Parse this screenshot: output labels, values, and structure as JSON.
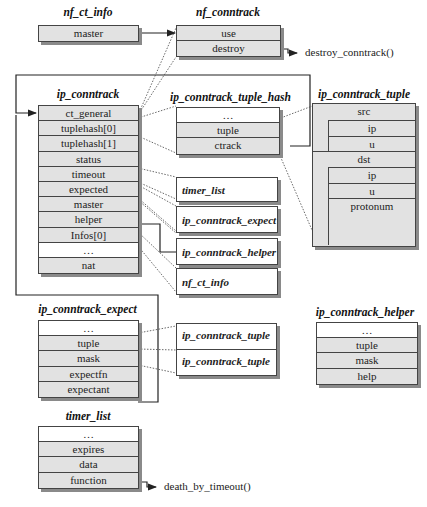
{
  "structs": {
    "nf_ct_info": {
      "title": "nf_ct_info",
      "fields": [
        "master"
      ]
    },
    "nf_conntrack": {
      "title": "nf_conntrack",
      "fields": [
        "use",
        "destroy"
      ],
      "destroy_target": "destroy_conntrack()"
    },
    "ip_conntrack": {
      "title": "ip_conntrack",
      "fields": [
        "ct_general",
        "tuplehash[0]",
        "tuplehash[1]",
        "status",
        "timeout",
        "expected",
        "master",
        "helper",
        "Infos[0]",
        "…",
        "nat"
      ]
    },
    "ip_conntrack_tuple_hash": {
      "title": "ip_conntrack_tuple_hash",
      "fields": [
        "…",
        "tuple",
        "ctrack"
      ]
    },
    "ip_conntrack_tuple": {
      "title": "ip_conntrack_tuple",
      "src": "src",
      "src_fields": [
        "ip",
        "u"
      ],
      "dst": "dst",
      "dst_fields": [
        "ip",
        "u"
      ],
      "protonum": "protonum"
    },
    "ip_conntrack_expect": {
      "title": "ip_conntrack_expect",
      "fields": [
        "…",
        "tuple",
        "mask",
        "expectfn",
        "expectant"
      ]
    },
    "ip_conntrack_helper": {
      "title": "ip_conntrack_helper",
      "fields": [
        "…",
        "tuple",
        "mask",
        "help"
      ]
    },
    "timer_list": {
      "title": "timer_list",
      "fields": [
        "…",
        "expires",
        "data",
        "function"
      ],
      "function_target": "death_by_timeout()"
    }
  },
  "refs": {
    "timer_list": "timer_list",
    "ip_conntrack_expect": "ip_conntrack_expect",
    "ip_conntrack_helper": "ip_conntrack_helper",
    "nf_ct_info": "nf_ct_info",
    "tuple_a": "ip_conntrack_tuple",
    "tuple_b": "ip_conntrack_tuple"
  }
}
